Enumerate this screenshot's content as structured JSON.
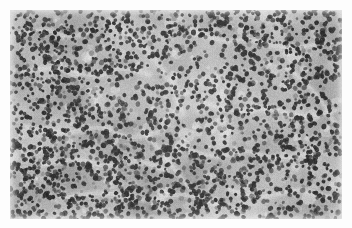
{
  "image": {
    "kind": "histopathology-micrograph",
    "modality": "brightfield light microscopy",
    "stain": "hematoxylin and eosin (rendered grayscale)",
    "color_mode": "grayscale",
    "width_px": 352,
    "height_px": 228,
    "caption_text": "",
    "scale_bar_text": "",
    "annotation_text": ""
  },
  "plate": {
    "margin_color": "#fdfdfd",
    "field_left_px": 10,
    "field_top_px": 10,
    "field_width_px": 332,
    "field_height_px": 209
  },
  "palette": {
    "paper_white": "#fdfdfd",
    "background_light": "#cfcfcb",
    "background_mid": "#aeaeaa",
    "background_dark": "#8e8e8a",
    "sinusoid_pale": "#e8e8e4",
    "nucleus_dark": "#2b2b2b",
    "nucleus_mid": "#4a4a4a",
    "nucleus_soft": "#6a6a68",
    "stroma_band": "#9b9b97"
  },
  "tissue": {
    "description": "Densely cellular field of small round dark-staining nuclei distributed on a pale gray cytoplasmic and stromal background, traversed by irregular pale sinusoidal spaces.",
    "nucleus_count_estimate": 2100,
    "nucleus_diameter_px_min": 2.6,
    "nucleus_diameter_px_max": 5.2,
    "nucleus_density_per_1000px2": 30,
    "cellularity": "high",
    "pattern": "diffuse sheet with interspersed pale sinusoids"
  },
  "texture_regions": [
    {
      "name": "upper-left-dense",
      "cx": 0.13,
      "cy": 0.14,
      "rx": 0.18,
      "ry": 0.17,
      "tone": "dark",
      "density": 1.2
    },
    {
      "name": "upper-center-pale",
      "cx": 0.42,
      "cy": 0.12,
      "rx": 0.17,
      "ry": 0.13,
      "tone": "light",
      "density": 0.78
    },
    {
      "name": "upper-right-moderate",
      "cx": 0.8,
      "cy": 0.16,
      "rx": 0.2,
      "ry": 0.16,
      "tone": "mid",
      "density": 1.02
    },
    {
      "name": "mid-left-dense",
      "cx": 0.11,
      "cy": 0.46,
      "rx": 0.15,
      "ry": 0.2,
      "tone": "dark",
      "density": 1.18
    },
    {
      "name": "center-pale-sinusoid",
      "cx": 0.47,
      "cy": 0.44,
      "rx": 0.19,
      "ry": 0.17,
      "tone": "light",
      "density": 0.74
    },
    {
      "name": "mid-right-washed",
      "cx": 0.78,
      "cy": 0.45,
      "rx": 0.18,
      "ry": 0.18,
      "tone": "light",
      "density": 0.82
    },
    {
      "name": "lower-left-dense",
      "cx": 0.18,
      "cy": 0.78,
      "rx": 0.19,
      "ry": 0.18,
      "tone": "dark",
      "density": 1.16
    },
    {
      "name": "lower-center-dense",
      "cx": 0.5,
      "cy": 0.82,
      "rx": 0.2,
      "ry": 0.16,
      "tone": "dark",
      "density": 1.12
    },
    {
      "name": "lower-right-moderate",
      "cx": 0.84,
      "cy": 0.8,
      "rx": 0.17,
      "ry": 0.17,
      "tone": "mid",
      "density": 1.0
    }
  ],
  "sinusoids": [
    {
      "points": [
        [
          0.02,
          0.3
        ],
        [
          0.14,
          0.26
        ],
        [
          0.26,
          0.33
        ],
        [
          0.33,
          0.27
        ],
        [
          0.42,
          0.31
        ]
      ],
      "width": 4.0
    },
    {
      "points": [
        [
          0.3,
          0.06
        ],
        [
          0.38,
          0.14
        ],
        [
          0.44,
          0.24
        ],
        [
          0.49,
          0.36
        ],
        [
          0.52,
          0.5
        ]
      ],
      "width": 4.6
    },
    {
      "points": [
        [
          0.55,
          0.1
        ],
        [
          0.64,
          0.16
        ],
        [
          0.72,
          0.13
        ],
        [
          0.82,
          0.19
        ],
        [
          0.94,
          0.16
        ]
      ],
      "width": 3.6
    },
    {
      "points": [
        [
          0.05,
          0.56
        ],
        [
          0.16,
          0.6
        ],
        [
          0.27,
          0.55
        ],
        [
          0.36,
          0.62
        ],
        [
          0.46,
          0.58
        ]
      ],
      "width": 4.2
    },
    {
      "points": [
        [
          0.58,
          0.44
        ],
        [
          0.68,
          0.5
        ],
        [
          0.78,
          0.46
        ],
        [
          0.88,
          0.52
        ],
        [
          0.98,
          0.48
        ]
      ],
      "width": 3.8
    },
    {
      "points": [
        [
          0.1,
          0.74
        ],
        [
          0.2,
          0.7
        ],
        [
          0.29,
          0.76
        ],
        [
          0.38,
          0.71
        ],
        [
          0.47,
          0.77
        ]
      ],
      "width": 4.0
    },
    {
      "points": [
        [
          0.52,
          0.66
        ],
        [
          0.62,
          0.72
        ],
        [
          0.7,
          0.66
        ],
        [
          0.8,
          0.72
        ],
        [
          0.92,
          0.68
        ]
      ],
      "width": 3.4
    },
    {
      "points": [
        [
          0.16,
          0.9
        ],
        [
          0.28,
          0.86
        ],
        [
          0.4,
          0.92
        ],
        [
          0.52,
          0.87
        ],
        [
          0.63,
          0.93
        ]
      ],
      "width": 3.9
    },
    {
      "points": [
        [
          0.66,
          0.86
        ],
        [
          0.76,
          0.91
        ],
        [
          0.86,
          0.85
        ],
        [
          0.97,
          0.9
        ]
      ],
      "width": 3.4
    },
    {
      "points": [
        [
          0.02,
          0.12
        ],
        [
          0.1,
          0.08
        ],
        [
          0.18,
          0.14
        ],
        [
          0.26,
          0.09
        ]
      ],
      "width": 3.2
    },
    {
      "points": [
        [
          0.4,
          0.58
        ],
        [
          0.46,
          0.68
        ],
        [
          0.5,
          0.78
        ],
        [
          0.56,
          0.88
        ]
      ],
      "width": 3.6
    },
    {
      "points": [
        [
          0.84,
          0.28
        ],
        [
          0.9,
          0.36
        ],
        [
          0.95,
          0.46
        ],
        [
          0.99,
          0.58
        ]
      ],
      "width": 3.2
    }
  ],
  "render": {
    "seed": 20240917,
    "grain_amount": 17,
    "blur_radius_px": 0.55,
    "vignette_strength": 0.22,
    "base_tone_mean": 176,
    "base_tone_range": 58
  }
}
